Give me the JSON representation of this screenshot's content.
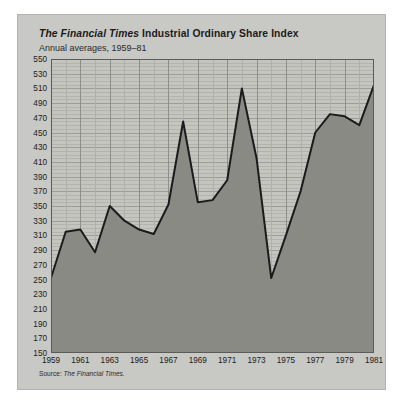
{
  "figure": {
    "title_italic": "The Financial Times",
    "title_rest": " Industrial Ordinary Share Index",
    "subtitle": "Annual averages, 1959–81",
    "source_label": "Source: ",
    "source_name": "The Financial Times.",
    "background_color": "#c8c8c4",
    "plot_background_color": "#c5c5c0",
    "area_fill_color": "#8a8a85",
    "line_color": "#1b1b1b",
    "grid_color": "#a8a8a3"
  },
  "chart_data": {
    "type": "area",
    "title": "The Financial Times Industrial Ordinary Share Index",
    "subtitle": "Annual averages, 1959–81",
    "xlabel": "",
    "ylabel": "",
    "grid": true,
    "legend": "none",
    "xlim": [
      1959,
      1981
    ],
    "ylim": [
      150,
      550
    ],
    "ytick_step": 20,
    "xtick_step": 2,
    "yticks": [
      150,
      170,
      190,
      210,
      230,
      250,
      270,
      290,
      310,
      330,
      350,
      370,
      390,
      410,
      430,
      450,
      470,
      490,
      510,
      530,
      550
    ],
    "xticks": [
      1959,
      1961,
      1963,
      1965,
      1967,
      1969,
      1971,
      1973,
      1975,
      1977,
      1979,
      1981
    ],
    "x": [
      1959,
      1960,
      1961,
      1962,
      1963,
      1964,
      1965,
      1966,
      1967,
      1968,
      1969,
      1970,
      1971,
      1972,
      1973,
      1974,
      1975,
      1976,
      1977,
      1978,
      1979,
      1980,
      1981
    ],
    "values": [
      252,
      315,
      318,
      287,
      350,
      330,
      318,
      312,
      352,
      465,
      355,
      358,
      385,
      510,
      415,
      252,
      310,
      370,
      450,
      475,
      472,
      460,
      515
    ],
    "series_name": "FT Industrial Ordinary Share Index"
  }
}
